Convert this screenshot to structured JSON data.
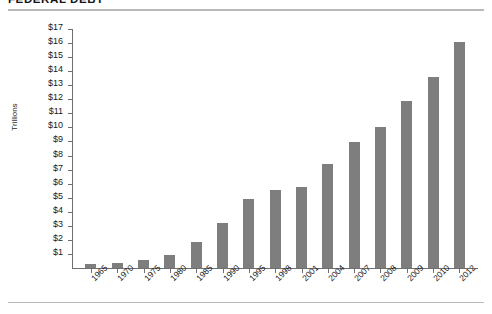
{
  "header": {
    "title": "FEDERAL DEBT"
  },
  "chart_data": {
    "type": "bar",
    "title": "FEDERAL DEBT",
    "subtitle": "",
    "xlabel": "",
    "ylabel": "Trillions",
    "categories": [
      "1965",
      "1970",
      "1975",
      "1980",
      "1985",
      "1990",
      "1995",
      "1998",
      "2001",
      "2004",
      "2007",
      "2008",
      "2009",
      "2010",
      "2012"
    ],
    "values": [
      0.32,
      0.38,
      0.54,
      0.91,
      1.82,
      3.23,
      4.92,
      5.53,
      5.77,
      7.38,
      8.95,
      10.02,
      11.91,
      13.56,
      16.05
    ],
    "series": [
      {
        "name": "Federal Debt",
        "values": [
          0.32,
          0.38,
          0.54,
          0.91,
          1.82,
          3.23,
          4.92,
          5.53,
          5.77,
          7.38,
          8.95,
          10.02,
          11.91,
          13.56,
          16.05
        ]
      }
    ],
    "ylim": [
      0,
      17
    ],
    "ytick_values": [
      1,
      2,
      3,
      4,
      5,
      6,
      7,
      8,
      9,
      10,
      11,
      12,
      13,
      14,
      15,
      16,
      17
    ],
    "ytick_labels": [
      "$1",
      "$2",
      "$3",
      "$4",
      "$5",
      "$6",
      "$7",
      "$8",
      "$9",
      "$10",
      "$11",
      "$12",
      "$13",
      "$14",
      "$15",
      "$16",
      "$17"
    ],
    "grid": false,
    "legend": false,
    "legend_position": "none",
    "bar_color": "#7e7e7e",
    "axis_color": "#6f6f6f",
    "rule_color": "#b9b9b9"
  }
}
